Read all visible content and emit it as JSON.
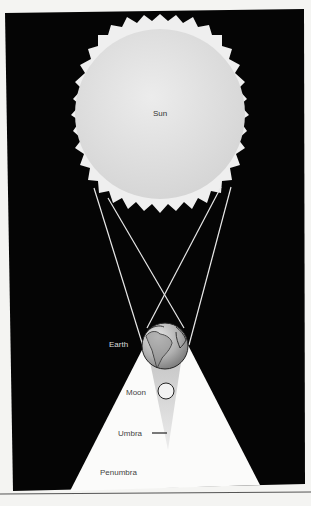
{
  "diagram": {
    "type": "lunar-eclipse-geometry",
    "colors": {
      "page": "#f4f4f2",
      "space": "#050505",
      "sun_disk": "#dedede",
      "corona": "#efefef",
      "penumbra": "#fbfbfa",
      "umbra": "#cfcfcf",
      "earth": "#a8a8a8",
      "rule": "#555555"
    },
    "labels": {
      "sun": "Sun",
      "earth": "Earth",
      "moon": "Moon",
      "umbra": "Umbra",
      "penumbra": "Penumbra"
    }
  }
}
